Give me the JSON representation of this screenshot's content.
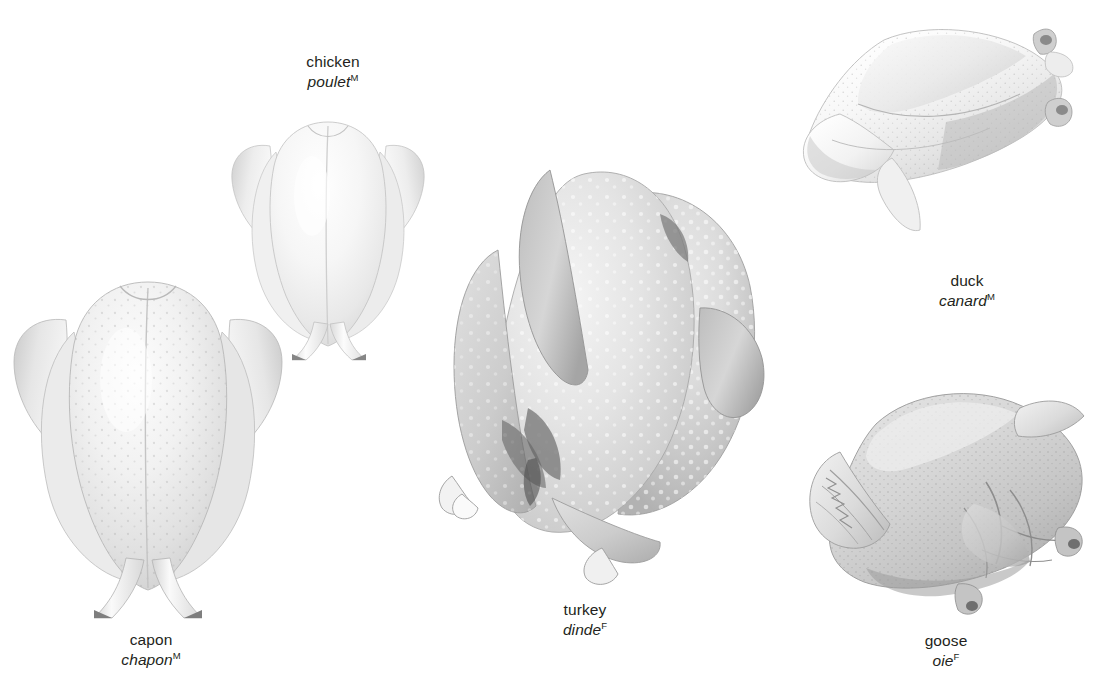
{
  "plate": {
    "title": "poultry",
    "background_color": "#ffffff",
    "label_color": "#231f20",
    "style": "grayscale airbrush illustration"
  },
  "birds": [
    {
      "id": "capon",
      "name_en": "capon",
      "name_fr": "chapon",
      "gender_mark": "M",
      "view": "breast-up, legs crossed downward",
      "tone": "very light gray with fine dotted skin pores",
      "label_x": 151,
      "label_y": 631
    },
    {
      "id": "chicken",
      "name_en": "chicken",
      "name_fr": "poulet",
      "gender_mark": "M",
      "view": "breast-up, legs crossed downward",
      "tone": "very light gray, smooth",
      "label_x": 333,
      "label_y": 53
    },
    {
      "id": "turkey",
      "name_en": "turkey",
      "name_fr": "dinde",
      "gender_mark": "F",
      "view": "trussed, rotated three-quarter",
      "tone": "mid gray with pronounced white dimpled pores",
      "label_x": 585,
      "label_y": 601
    },
    {
      "id": "duck",
      "name_en": "duck",
      "name_fr": "canard",
      "gender_mark": "M",
      "view": "lying on side, tilted diagonally",
      "tone": "pale white-gray, soft shading",
      "label_x": 967,
      "label_y": 272
    },
    {
      "id": "goose",
      "name_en": "goose",
      "name_fr": "oie",
      "gender_mark": "F",
      "view": "lying on side, wing folded, tilted diagonally",
      "tone": "medium warm gray with stippled texture and skin folds",
      "label_x": 946,
      "label_y": 632
    }
  ]
}
